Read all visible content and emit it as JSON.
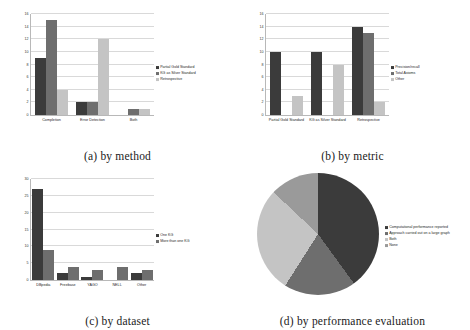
{
  "figure": {
    "panels": [
      {
        "caption": "(a) by method"
      },
      {
        "caption": "(b) by metric"
      },
      {
        "caption": "(c) by dataset"
      },
      {
        "caption": "(d) by performance evaluation"
      }
    ]
  },
  "colors": {
    "series_1": "#3b3b3b",
    "series_2": "#6e6e6e",
    "series_3": "#c4c4c4",
    "series_4": "#9a9a9a",
    "gridline": "#d9d9d9",
    "axis": "#b8b8b8"
  },
  "chart_data": [
    {
      "id": "a",
      "type": "bar",
      "title": "(a) by method",
      "xlabel": "",
      "ylabel": "",
      "ylim": [
        0,
        16
      ],
      "yticks": [
        "0",
        "2",
        "4",
        "6",
        "8",
        "10",
        "12",
        "14",
        "16"
      ],
      "grid": true,
      "legend_position": "right",
      "categories": [
        "Completion",
        "Error Detection",
        "Both"
      ],
      "series": [
        {
          "name": "Partial Gold Standard",
          "values": [
            9,
            2,
            0
          ]
        },
        {
          "name": "KG as Silver Standard",
          "values": [
            15,
            2,
            1
          ]
        },
        {
          "name": "Retrospective",
          "values": [
            4,
            12,
            1
          ]
        }
      ]
    },
    {
      "id": "b",
      "type": "bar",
      "title": "(b) by metric",
      "xlabel": "",
      "ylabel": "",
      "ylim": [
        0,
        16
      ],
      "yticks": [
        "0",
        "2",
        "4",
        "6",
        "8",
        "10",
        "12",
        "14",
        "16"
      ],
      "grid": true,
      "legend_position": "right",
      "categories": [
        "Partial Gold Standard",
        "KG as Silver Standard",
        "Retrospective"
      ],
      "series": [
        {
          "name": "Precision/recall",
          "values": [
            10,
            10,
            14
          ]
        },
        {
          "name": "Total Axioms",
          "values": [
            0,
            0,
            13
          ]
        },
        {
          "name": "Other",
          "values": [
            3,
            8,
            2
          ]
        }
      ]
    },
    {
      "id": "c",
      "type": "bar",
      "title": "(c) by dataset",
      "xlabel": "",
      "ylabel": "",
      "ylim": [
        0,
        30
      ],
      "yticks": [
        "0",
        "5",
        "10",
        "15",
        "20",
        "25",
        "30"
      ],
      "grid": true,
      "legend_position": "right",
      "categories": [
        "DBpedia",
        "Freebase",
        "YAGO",
        "NELL",
        "Other"
      ],
      "series": [
        {
          "name": "One KG",
          "values": [
            27,
            2,
            1,
            0,
            2
          ]
        },
        {
          "name": "More than one KG",
          "values": [
            9,
            4,
            3,
            4,
            3
          ]
        }
      ]
    },
    {
      "id": "d",
      "type": "pie",
      "title": "(d) by performance evaluation",
      "legend_position": "right",
      "labels": [
        "Computational performance reported",
        "Approach carried out on a large graph",
        "Both",
        "None"
      ],
      "values": [
        40,
        19,
        28,
        13
      ]
    }
  ]
}
